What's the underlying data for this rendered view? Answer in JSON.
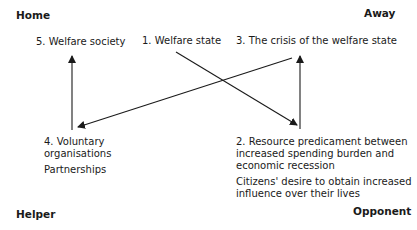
{
  "corners": {
    "top_left": "Home",
    "top_right": "Away",
    "bottom_left": "Helper",
    "bottom_right": "Opponent"
  },
  "nodes": {
    "n5": "5. Welfare society",
    "n1": "1. Welfare state",
    "n3": "3. The crisis of the welfare state",
    "n4_line1": "4. Voluntary",
    "n4_line2": "organisations",
    "n4_sub": "Partnerships",
    "n2_line1": "2. Resource predicament between",
    "n2_line2": "increased spending burden and",
    "n2_line3": "economic recession",
    "n2_sub_line1": "Citizens' desire to obtain increased",
    "n2_sub_line2": "influence over their lives"
  },
  "edges": [
    {
      "from": "1. Welfare state",
      "to": "2. Resource predicament"
    },
    {
      "from": "2. Resource predicament",
      "to": "3. The crisis of the welfare state"
    },
    {
      "from": "3. The crisis of the welfare state",
      "to": "4. Voluntary organisations"
    },
    {
      "from": "4. Voluntary organisations",
      "to": "5. Welfare society"
    }
  ]
}
